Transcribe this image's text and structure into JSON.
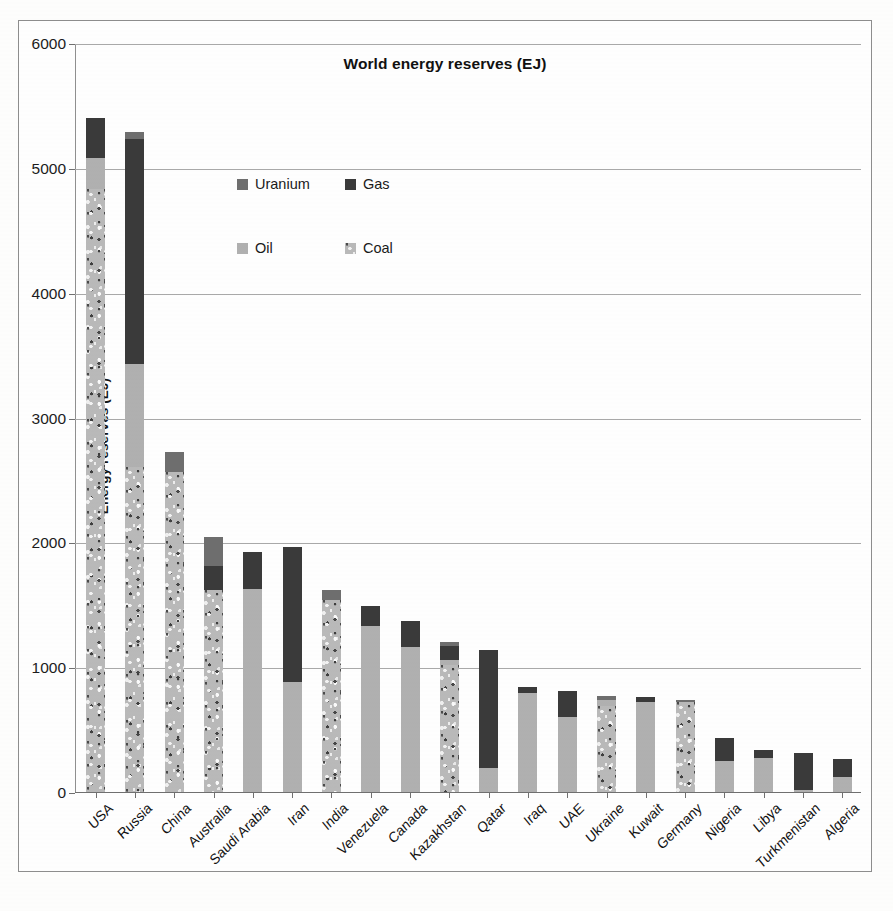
{
  "chart_data": {
    "type": "bar",
    "subtype": "stacked-vertical",
    "title": "World energy reserves (EJ)",
    "xlabel": "",
    "ylabel": "Energy reserves (EJ)",
    "ylim": [
      0,
      6000
    ],
    "ytick_labels": [
      "0",
      "1000",
      "2000",
      "3000",
      "4000",
      "5000",
      "6000"
    ],
    "yticks": [
      0,
      1000,
      2000,
      3000,
      4000,
      5000,
      6000
    ],
    "grid": "horizontal",
    "legend_position": "inside-top-center",
    "legend_order": [
      "Uranium",
      "Gas",
      "Oil",
      "Coal"
    ],
    "stack_order_bottom_to_top": [
      "Coal",
      "Oil",
      "Gas",
      "Uranium"
    ],
    "colors": {
      "Coal": "#b9b9b9",
      "Oil": "#b0b0b0",
      "Gas": "#3a3a3a",
      "Uranium": "#6e6e6e"
    },
    "categories": [
      "USA",
      "Russia",
      "China",
      "Australia",
      "Saudi Arabia",
      "Iran",
      "India",
      "Venezuela",
      "Canada",
      "Kazakhstan",
      "Qatar",
      "Iraq",
      "UAE",
      "Ukraine",
      "Kuwait",
      "Germany",
      "Nigeria",
      "Libya",
      "Turkmenistan",
      "Algeria"
    ],
    "series": [
      {
        "name": "Coal",
        "values": [
          4830,
          2600,
          2560,
          1620,
          0,
          0,
          1540,
          0,
          0,
          1020,
          0,
          0,
          0,
          690,
          0,
          720,
          0,
          0,
          0,
          0
        ]
      },
      {
        "name": "Oil",
        "values": [
          250,
          830,
          0,
          0,
          1630,
          880,
          0,
          1330,
          1160,
          40,
          190,
          790,
          600,
          50,
          720,
          0,
          250,
          270,
          20,
          120
        ]
      },
      {
        "name": "Gas",
        "values": [
          320,
          1800,
          0,
          190,
          290,
          1080,
          0,
          160,
          210,
          110,
          950,
          50,
          210,
          0,
          40,
          0,
          180,
          70,
          290,
          145
        ]
      },
      {
        "name": "Uranium",
        "values": [
          0,
          60,
          160,
          230,
          0,
          0,
          80,
          0,
          0,
          30,
          0,
          0,
          0,
          30,
          0,
          15,
          0,
          0,
          0,
          0
        ]
      }
    ],
    "totals": [
      5400,
      5290,
      2720,
      2040,
      1920,
      1960,
      1620,
      1490,
      1370,
      1200,
      1140,
      840,
      810,
      770,
      760,
      735,
      430,
      340,
      310,
      265
    ]
  },
  "legend": {
    "items": [
      {
        "label": "Uranium",
        "fill": "uranium"
      },
      {
        "label": "Gas",
        "fill": "gas"
      },
      {
        "label": "Oil",
        "fill": "oil"
      },
      {
        "label": "Coal",
        "fill": "coal"
      }
    ]
  }
}
